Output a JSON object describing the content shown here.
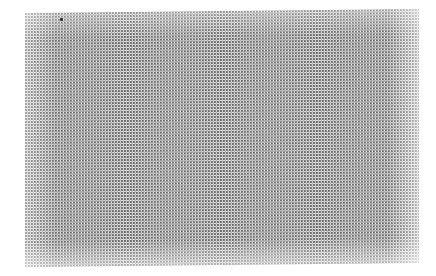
{
  "image": {
    "description": "Halftone dot-pattern texture on white background",
    "texture_color": "#f4f4f4",
    "dot_color": "#3c3c3c",
    "background": "#ffffff",
    "marks": [
      {
        "x": 60,
        "y": 18
      }
    ]
  }
}
